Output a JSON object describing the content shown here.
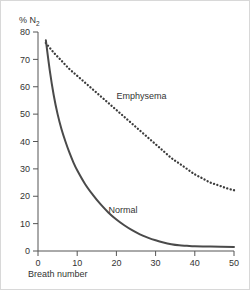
{
  "chart_data": {
    "type": "line",
    "title": "",
    "xlabel": "Breath number",
    "ylabel": "% N2",
    "ylabel_main": "% N",
    "ylabel_sub": "2",
    "xlim": [
      0,
      50
    ],
    "ylim": [
      0,
      80
    ],
    "grid": false,
    "legend": "inline-annotations",
    "xticks": [
      0,
      10,
      20,
      30,
      40,
      50
    ],
    "yticks": [
      0,
      10,
      20,
      30,
      40,
      50,
      60,
      70,
      80
    ],
    "xtick_labels": [
      "0",
      "10",
      "20",
      "30",
      "40",
      "50"
    ],
    "ytick_labels": [
      "0",
      "10",
      "20",
      "30",
      "40",
      "50",
      "60",
      "70",
      "80"
    ],
    "series": [
      {
        "name": "Normal",
        "style": "solid",
        "color": "#4a4a4a",
        "label_x": 18,
        "label_y": 14,
        "x": [
          2,
          3,
          4,
          5,
          6,
          7,
          8,
          9,
          10,
          12,
          14,
          16,
          18,
          20,
          22,
          24,
          26,
          28,
          30,
          32,
          34,
          36,
          38,
          40,
          44,
          50
        ],
        "values": [
          77,
          66,
          57,
          50,
          44.5,
          40,
          36,
          32.5,
          29.5,
          24.5,
          20.5,
          17,
          14,
          11.5,
          9.4,
          7.6,
          6.1,
          4.9,
          3.9,
          3.1,
          2.5,
          2.1,
          1.9,
          1.7,
          1.6,
          1.5
        ]
      },
      {
        "name": "Emphysema",
        "style": "dotted",
        "color": "#3c3c3c",
        "label_x": 20,
        "label_y": 55.5,
        "x": [
          2,
          4,
          6,
          8,
          10,
          12,
          14,
          16,
          18,
          20,
          22,
          24,
          26,
          28,
          30,
          32,
          34,
          36,
          38,
          40,
          42,
          44,
          46,
          48,
          50
        ],
        "values": [
          76,
          72.5,
          69.5,
          66.5,
          64,
          61.5,
          59,
          56.5,
          54,
          51.5,
          49,
          46.5,
          44,
          41.5,
          39,
          36.5,
          34,
          32,
          30,
          28,
          26.5,
          25,
          24,
          23,
          22.2
        ]
      }
    ],
    "annotations": [
      {
        "text": "Emphysema",
        "x": 20,
        "y": 55.5
      },
      {
        "text": "Normal",
        "x": 18,
        "y": 14
      }
    ]
  },
  "colors": {
    "axis": "#555555",
    "text": "#333333",
    "normal_line": "#4a4a4a",
    "emphysema_line": "#3c3c3c",
    "background": "#ffffff",
    "frame": "#d8d8d8"
  }
}
